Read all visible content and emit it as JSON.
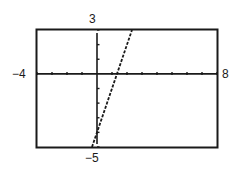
{
  "chart_data": {
    "type": "line",
    "title": "",
    "xlabel": "",
    "ylabel": "",
    "xlim": [
      -4,
      8
    ],
    "ylim": [
      -5,
      3
    ],
    "xscale": 1,
    "yscale": 1,
    "grid": false,
    "window_labels": {
      "xmin": "−4",
      "xmax": "8",
      "ymin": "−5",
      "ymax": "3"
    },
    "series": [
      {
        "name": "y = 3x - 4",
        "style": "dashed",
        "color": "#1a1a1a",
        "x": [
          -0.333,
          2.333
        ],
        "y": [
          -5,
          3
        ]
      }
    ],
    "x_intercept": 1.333,
    "y_intercept": -4
  },
  "frame": {
    "color": "#1a1a1a"
  }
}
